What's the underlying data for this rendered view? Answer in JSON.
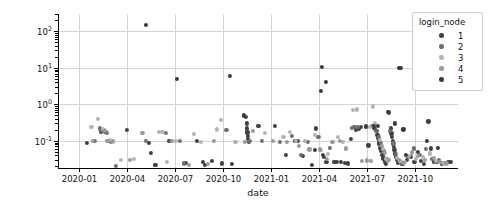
{
  "chart_data": {
    "type": "scatter",
    "title": "",
    "xlabel": "date",
    "ylabel": "home_ls_real",
    "yscale": "log",
    "ylim": [
      0.018,
      300
    ],
    "xlim": [
      "2019-11-20",
      "2021-12-20"
    ],
    "grid": true,
    "legend": {
      "title": "login_node",
      "position": "upper right",
      "entries": [
        {
          "label": "1",
          "color": "#404040"
        },
        {
          "label": "2",
          "color": "#6e6e6e"
        },
        {
          "label": "3",
          "color": "#b4b4b4"
        },
        {
          "label": "4",
          "color": "#9a9a9a"
        },
        {
          "label": "5",
          "color": "#3a3a3a"
        }
      ]
    },
    "xticklabels": [
      "2020-01",
      "2020-04",
      "2020-07",
      "2020-10",
      "2021-01",
      "2021-04",
      "2021-07",
      "2021-10"
    ],
    "xtickvalues": [
      2020.0,
      2020.25,
      2020.5,
      2020.75,
      2021.0,
      2021.25,
      2021.5,
      2021.75
    ],
    "yticklabels": [
      "10⁻¹",
      "10⁰",
      "10¹",
      "10²"
    ],
    "ytickvalues": [
      0.1,
      1,
      10,
      100
    ],
    "series": [
      {
        "name": "1",
        "color": "#404040",
        "points": [
          [
            2020.038,
            0.086
          ],
          [
            2020.112,
            0.18
          ],
          [
            2020.128,
            0.2
          ],
          [
            2020.135,
            0.175
          ],
          [
            2020.246,
            0.2
          ],
          [
            2020.362,
            0.088
          ],
          [
            2020.371,
            0.047
          ],
          [
            2020.395,
            0.022
          ],
          [
            2020.468,
            0.1
          ],
          [
            2020.556,
            0.025
          ],
          [
            2020.612,
            0.1
          ],
          [
            2020.641,
            0.027
          ],
          [
            2020.655,
            0.022
          ],
          [
            2020.688,
            0.028
          ],
          [
            2020.742,
            0.024
          ],
          [
            2020.792,
            0.023
          ],
          [
            2020.869,
            0.45
          ],
          [
            2020.871,
            0.3
          ],
          [
            2020.873,
            0.22
          ],
          [
            2020.875,
            0.17
          ],
          [
            2020.877,
            0.14
          ],
          [
            2020.879,
            0.115
          ],
          [
            2020.881,
            0.1
          ],
          [
            2020.883,
            0.092
          ],
          [
            2020.932,
            0.26
          ],
          [
            2021.018,
            0.26
          ],
          [
            2021.075,
            0.041
          ],
          [
            2021.121,
            0.1
          ],
          [
            2021.138,
            0.1
          ],
          [
            2021.165,
            0.038
          ],
          [
            2021.212,
            0.022
          ],
          [
            2021.233,
            0.22
          ],
          [
            2021.268,
            0.042
          ],
          [
            2021.272,
            0.036
          ],
          [
            2021.286,
            0.026
          ],
          [
            2021.328,
            0.026
          ],
          [
            2021.342,
            0.026
          ],
          [
            2021.361,
            0.026
          ],
          [
            2021.381,
            0.025
          ],
          [
            2021.398,
            0.024
          ],
          [
            2021.412,
            0.115
          ],
          [
            2021.441,
            0.2
          ],
          [
            2021.455,
            0.21
          ],
          [
            2021.468,
            0.24
          ],
          [
            2021.505,
            0.075
          ],
          [
            2021.532,
            0.23
          ],
          [
            2021.541,
            0.21
          ],
          [
            2021.548,
            0.185
          ],
          [
            2021.552,
            0.145
          ],
          [
            2021.556,
            0.12
          ],
          [
            2021.559,
            0.098
          ],
          [
            2021.562,
            0.085
          ],
          [
            2021.566,
            0.065
          ],
          [
            2021.571,
            0.052
          ],
          [
            2021.578,
            0.041
          ],
          [
            2021.583,
            0.033
          ],
          [
            2021.59,
            0.027
          ],
          [
            2021.598,
            0.024
          ],
          [
            2021.612,
            0.6
          ],
          [
            2021.621,
            0.22
          ],
          [
            2021.625,
            0.16
          ],
          [
            2021.628,
            0.125
          ],
          [
            2021.631,
            0.1
          ],
          [
            2021.634,
            0.082
          ],
          [
            2021.637,
            0.068
          ],
          [
            2021.641,
            0.055
          ],
          [
            2021.645,
            0.045
          ],
          [
            2021.65,
            0.036
          ],
          [
            2021.655,
            0.03
          ],
          [
            2021.661,
            0.025
          ],
          [
            2021.682,
            0.023
          ],
          [
            2021.705,
            0.03
          ],
          [
            2021.728,
            0.037
          ],
          [
            2021.745,
            0.026
          ],
          [
            2021.762,
            0.05
          ],
          [
            2021.778,
            0.028
          ],
          [
            2021.795,
            0.023
          ],
          [
            2021.818,
            0.34
          ],
          [
            2021.832,
            0.062
          ],
          [
            2021.848,
            0.027
          ],
          [
            2021.862,
            0.026
          ],
          [
            2021.888,
            0.024
          ],
          [
            2021.905,
            0.025
          ],
          [
            2021.922,
            0.026
          ]
        ]
      },
      {
        "name": "2",
        "color": "#6e6e6e",
        "points": [
          [
            2020.078,
            0.098
          ],
          [
            2020.105,
            0.22
          ],
          [
            2020.118,
            0.19
          ],
          [
            2020.142,
            0.165
          ],
          [
            2020.152,
            0.1
          ],
          [
            2020.165,
            0.095
          ],
          [
            2020.188,
            0.021
          ],
          [
            2020.345,
            0.1
          ],
          [
            2020.452,
            0.165
          ],
          [
            2020.478,
            0.1
          ],
          [
            2020.525,
            0.098
          ],
          [
            2020.542,
            0.024
          ],
          [
            2020.765,
            0.195
          ],
          [
            2020.885,
            0.1
          ],
          [
            2020.952,
            0.102
          ],
          [
            2021.045,
            0.095
          ],
          [
            2021.108,
            0.14
          ],
          [
            2021.152,
            0.042
          ],
          [
            2021.188,
            0.095
          ],
          [
            2021.245,
            0.125
          ],
          [
            2021.305,
            0.065
          ],
          [
            2021.418,
            0.23
          ],
          [
            2021.432,
            0.235
          ],
          [
            2021.452,
            0.24
          ],
          [
            2021.522,
            0.26
          ],
          [
            2021.545,
            0.19
          ],
          [
            2021.558,
            0.13
          ],
          [
            2021.572,
            0.088
          ],
          [
            2021.588,
            0.052
          ],
          [
            2021.602,
            0.031
          ],
          [
            2021.618,
            0.19
          ],
          [
            2021.635,
            0.085
          ],
          [
            2021.648,
            0.043
          ],
          [
            2021.668,
            0.026
          ],
          [
            2021.712,
            0.036
          ],
          [
            2021.742,
            0.062
          ],
          [
            2021.772,
            0.041
          ],
          [
            2021.805,
            0.06
          ],
          [
            2021.838,
            0.032
          ],
          [
            2021.872,
            0.03
          ]
        ]
      },
      {
        "name": "3",
        "color": "#b4b4b4",
        "points": [
          [
            2020.062,
            0.24
          ],
          [
            2020.095,
            0.4
          ],
          [
            2020.122,
            0.21
          ],
          [
            2020.158,
            0.105
          ],
          [
            2020.175,
            0.092
          ],
          [
            2020.215,
            0.03
          ],
          [
            2020.285,
            0.032
          ],
          [
            2020.412,
            0.178
          ],
          [
            2020.432,
            0.172
          ],
          [
            2020.455,
            0.027
          ],
          [
            2020.502,
            0.1
          ],
          [
            2020.598,
            0.155
          ],
          [
            2020.632,
            0.095
          ],
          [
            2020.718,
            0.205
          ],
          [
            2020.735,
            0.38
          ],
          [
            2020.812,
            0.092
          ],
          [
            2020.965,
            0.165
          ],
          [
            2021.062,
            0.125
          ],
          [
            2021.098,
            0.175
          ],
          [
            2021.128,
            0.098
          ],
          [
            2021.175,
            0.098
          ],
          [
            2021.225,
            0.145
          ],
          [
            2021.258,
            0.055
          ],
          [
            2021.295,
            0.043
          ],
          [
            2021.345,
            0.125
          ],
          [
            2021.372,
            0.095
          ],
          [
            2021.425,
            0.7
          ],
          [
            2021.445,
            0.73
          ],
          [
            2021.492,
            0.235
          ],
          [
            2021.512,
            0.24
          ],
          [
            2021.528,
            0.88
          ],
          [
            2021.538,
            0.3
          ],
          [
            2021.565,
            0.105
          ],
          [
            2021.58,
            0.06
          ],
          [
            2021.595,
            0.032
          ],
          [
            2021.608,
            0.028
          ],
          [
            2021.655,
            0.034
          ],
          [
            2021.672,
            0.028
          ],
          [
            2021.695,
            0.026
          ],
          [
            2021.718,
            0.038
          ],
          [
            2021.752,
            0.032
          ],
          [
            2021.788,
            0.036
          ],
          [
            2021.825,
            0.045
          ],
          [
            2021.858,
            0.028
          ],
          [
            2021.892,
            0.025
          ]
        ]
      },
      {
        "name": "4",
        "color": "#9a9a9a",
        "points": [
          [
            2020.068,
            0.1
          ],
          [
            2020.132,
            0.185
          ],
          [
            2020.145,
            0.098
          ],
          [
            2020.172,
            0.098
          ],
          [
            2020.262,
            0.03
          ],
          [
            2020.328,
            0.165
          ],
          [
            2020.482,
            0.098
          ],
          [
            2020.572,
            0.022
          ],
          [
            2020.668,
            0.023
          ],
          [
            2020.702,
            0.098
          ],
          [
            2020.862,
            0.095
          ],
          [
            2020.905,
            0.185
          ],
          [
            2021.008,
            0.098
          ],
          [
            2021.082,
            0.092
          ],
          [
            2021.142,
            0.072
          ],
          [
            2021.198,
            0.058
          ],
          [
            2021.252,
            0.058
          ],
          [
            2021.288,
            0.032
          ],
          [
            2021.318,
            0.095
          ],
          [
            2021.355,
            0.098
          ],
          [
            2021.388,
            0.062
          ],
          [
            2021.472,
            0.028
          ],
          [
            2021.498,
            0.029
          ],
          [
            2021.518,
            0.028
          ],
          [
            2021.575,
            0.072
          ],
          [
            2021.592,
            0.046
          ],
          [
            2021.612,
            0.03
          ],
          [
            2021.665,
            0.03
          ],
          [
            2021.688,
            0.025
          ],
          [
            2021.732,
            0.048
          ],
          [
            2021.765,
            0.038
          ],
          [
            2021.798,
            0.03
          ],
          [
            2021.845,
            0.034
          ],
          [
            2021.878,
            0.026
          ],
          [
            2021.912,
            0.024
          ]
        ]
      },
      {
        "name": "5",
        "color": "#3a3a3a",
        "points": [
          [
            2020.345,
            150.0
          ],
          [
            2020.508,
            5.0
          ],
          [
            2020.782,
            6.0
          ],
          [
            2021.265,
            10.5
          ],
          [
            2021.282,
            4.2
          ],
          [
            2021.258,
            2.3
          ],
          [
            2021.665,
            10.0
          ],
          [
            2021.672,
            9.8
          ],
          [
            2020.858,
            0.5
          ],
          [
            2021.228,
            0.055
          ],
          [
            2021.492,
            0.25
          ],
          [
            2021.535,
            0.255
          ],
          [
            2021.555,
            0.26
          ],
          [
            2021.605,
            0.62
          ],
          [
            2021.642,
            0.3
          ],
          [
            2021.688,
            0.205
          ],
          [
            2021.702,
            0.042
          ],
          [
            2021.808,
            0.1
          ],
          [
            2021.868,
            0.065
          ],
          [
            2021.935,
            0.026
          ]
        ]
      }
    ]
  }
}
